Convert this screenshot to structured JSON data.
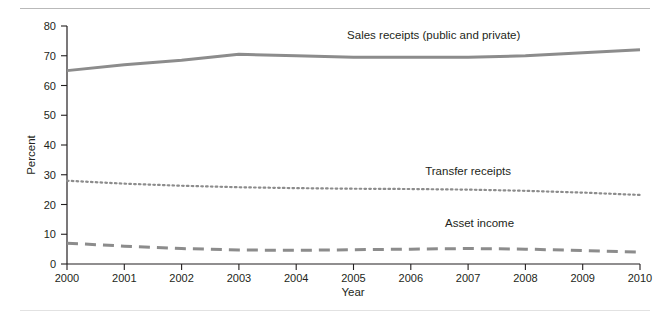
{
  "chart_data": {
    "type": "line",
    "title": "",
    "xlabel": "Year",
    "ylabel": "Percent",
    "xlim": [
      2000,
      2010
    ],
    "ylim": [
      0,
      80
    ],
    "grid": false,
    "legend_position": "inline-annotations",
    "x": [
      2000,
      2001,
      2002,
      2003,
      2004,
      2005,
      2006,
      2007,
      2008,
      2009,
      2010
    ],
    "xticks": [
      "2000",
      "2001",
      "2002",
      "2003",
      "2004",
      "2005",
      "2006",
      "2007",
      "2008",
      "2009",
      "2010"
    ],
    "yticks": [
      "0",
      "10",
      "20",
      "30",
      "40",
      "50",
      "60",
      "70",
      "80"
    ],
    "ytick_values": [
      0,
      10,
      20,
      30,
      40,
      50,
      60,
      70,
      80
    ],
    "series": [
      {
        "name": "Sales receipts (public and private)",
        "style": "solid",
        "color": "#8c8c8c",
        "values": [
          65.0,
          67.0,
          68.5,
          70.5,
          70.0,
          69.5,
          69.5,
          69.5,
          70.0,
          71.0,
          72.0
        ],
        "label": "Sales receipts (public and private)"
      },
      {
        "name": "Transfer receipts",
        "style": "dotted",
        "color": "#8c8c8c",
        "values": [
          28.0,
          27.0,
          26.3,
          25.8,
          25.5,
          25.3,
          25.2,
          25.0,
          24.6,
          24.0,
          23.2
        ],
        "label": "Transfer receipts"
      },
      {
        "name": "Asset income",
        "style": "dashed",
        "color": "#8c8c8c",
        "values": [
          7.0,
          6.0,
          5.2,
          4.7,
          4.6,
          4.8,
          5.0,
          5.2,
          5.0,
          4.5,
          4.0
        ],
        "label": "Asset income"
      }
    ],
    "annotations": [
      {
        "text": "Sales receipts (public and private)",
        "x": 2006.4,
        "y": 75.5
      },
      {
        "text": "Transfer receipts",
        "x": 2007.0,
        "y": 30.0
      },
      {
        "text": "Asset income",
        "x": 2007.2,
        "y": 12.5
      }
    ]
  },
  "axes": {
    "y_title": "Percent",
    "x_title": "Year"
  }
}
